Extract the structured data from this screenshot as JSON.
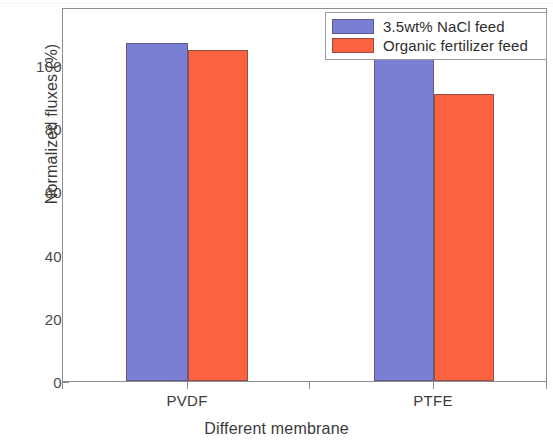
{
  "chart_data": {
    "type": "bar",
    "title": "",
    "xlabel": "Different membrane",
    "ylabel": "Normalized fluxes (%)",
    "categories": [
      "PVDF",
      "PTFE"
    ],
    "series": [
      {
        "name": "3.5wt% NaCl feed",
        "color": "#7b7fd4",
        "values": [
          100,
          99.5
        ]
      },
      {
        "name": "Organic fertilizer feed",
        "color": "#fa6240",
        "values": [
          98,
          85
        ]
      }
    ],
    "ylim": [
      0,
      110
    ],
    "yticks": [
      0,
      20,
      40,
      60,
      80,
      100
    ],
    "ytick_labels": [
      "0",
      "20",
      "40",
      "60",
      "80",
      "100"
    ],
    "grid": false,
    "legend_position": "top-right",
    "frame": true
  },
  "legend": {
    "items": [
      {
        "label": "3.5wt% NaCl feed",
        "color": "#7b7fd4"
      },
      {
        "label": "Organic fertilizer feed",
        "color": "#fa6240"
      }
    ]
  },
  "axes": {
    "y_title": "Normalized fluxes (%)",
    "x_title": "Different membrane",
    "y_ticks": [
      "100",
      "80",
      "60",
      "40",
      "20",
      "0"
    ],
    "x_ticks": [
      "PVDF",
      "PTFE"
    ]
  }
}
